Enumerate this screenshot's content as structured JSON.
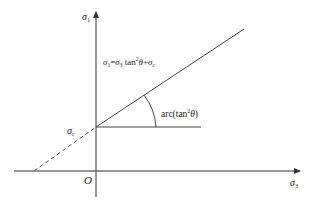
{
  "diagram": {
    "type": "strength-envelope",
    "axes": {
      "y_label": "σ",
      "y_label_sub": "1",
      "x_label": "σ",
      "x_label_sub": "3",
      "origin_label": "O"
    },
    "intercept": {
      "label": "σ",
      "label_sub": "c"
    },
    "equation": {
      "lhs": "σ",
      "lhs_sub": "1",
      "eq": "=",
      "term1": "σ",
      "term1_sub": "3",
      "tan": " tan",
      "tan_sup": "2",
      "theta": "θ",
      "plus": "+",
      "term2": "σ",
      "term2_sub": "c"
    },
    "angle": {
      "label_prefix": "arc(tan",
      "label_sup": "2",
      "label_theta": "θ",
      "label_suffix": ")"
    },
    "colors": {
      "line": "#444444",
      "axis": "#333333",
      "text": "#222222",
      "background": "#ffffff"
    }
  }
}
